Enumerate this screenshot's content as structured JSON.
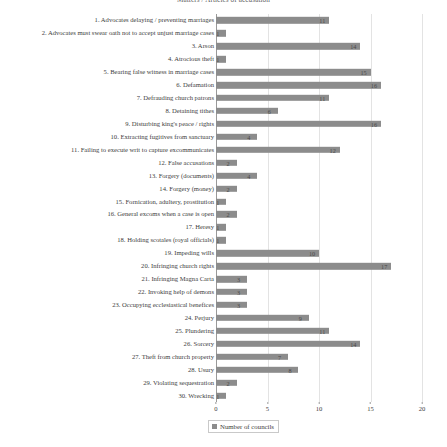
{
  "chart_data": {
    "type": "bar",
    "orientation": "horizontal",
    "title": "Matters / Articles of accusation",
    "xlabel": "",
    "ylabel": "",
    "xlim": [
      0,
      20
    ],
    "xticks": [
      0,
      5,
      10,
      15,
      20
    ],
    "grid": true,
    "legend_position": "bottom-left",
    "series": [
      {
        "name": "Number of councils",
        "color": "#8c8c8c",
        "values": [
          11,
          1,
          14,
          1,
          15,
          16,
          11,
          6,
          16,
          4,
          12,
          2,
          4,
          2,
          1,
          2,
          1,
          1,
          10,
          17,
          3,
          3,
          3,
          9,
          11,
          14,
          7,
          8,
          2,
          1
        ]
      }
    ],
    "categories": [
      "1. Advocates delaying / preventing marriages",
      "2. Advocates must swear oath not to accept unjust marriage cases",
      "3. Arson",
      "4. Atrocious theft",
      "5. Bearing false witness in marriage cases",
      "6. Defamation",
      "7. Defrauding church patrons",
      "8. Detaining tithes",
      "9. Disturbing king's peace / rights",
      "10. Extracting fugitives from sanctuary",
      "11. Failing to execute writ to capture excommunicates",
      "12. False accusations",
      "13. Forgery (documents)",
      "14. Forgery (money)",
      "15. Fornication, adultery, prostitution",
      "16. General excoms when a case is open",
      "17. Heresy",
      "18. Holding scotales (royal officials)",
      "19. Impeding wills",
      "20. Infringing church rights",
      "21. Infringing Magna Carta",
      "22. Invoking help of demons",
      "23. Occupying ecclesiastical benefices",
      "24. Perjury",
      "25. Plundering",
      "26. Sorcery",
      "27. Theft from church property",
      "28. Usury",
      "29. Violating sequestration",
      "30. Wrecking"
    ]
  },
  "legend": {
    "label": "Number of councils"
  },
  "colors": {
    "bar": "#8c8c8c",
    "grid": "#e3e3e3",
    "axis": "#9a9a9a",
    "text": "#3d3d3d",
    "background": "#ffffff"
  }
}
